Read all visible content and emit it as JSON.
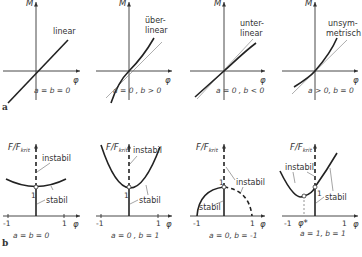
{
  "figure": {
    "part_a": {
      "label": "a",
      "y_axis_label": "M",
      "x_axis_label": "φ",
      "panels": [
        {
          "curve_label_1": "linear",
          "curve_label_2": "",
          "caption": "a = b = 0"
        },
        {
          "curve_label_1": "über-",
          "curve_label_2": "linear",
          "caption": "a = 0 , b > 0"
        },
        {
          "curve_label_1": "unter-",
          "curve_label_2": "linear",
          "caption": "a = 0 , b < 0"
        },
        {
          "curve_label_1": "unsym-",
          "curve_label_2": "metrisch",
          "caption": "a > 0, b = 0"
        }
      ]
    },
    "part_b": {
      "label": "b",
      "y_axis_label": "F/F",
      "y_axis_sub": "krit",
      "x_axis_label": "φ",
      "tick_neg": "-1",
      "tick_pos": "1",
      "tick_one": "1",
      "panels": [
        {
          "instabil": "instabil",
          "stabil": "stabil",
          "caption": "a = b = 0"
        },
        {
          "instabil": "instabil",
          "stabil": "stabil",
          "caption": "a = 0 , b = 1"
        },
        {
          "instabil": "instabil",
          "stabil": "stabil",
          "caption": "a = 0, b = -1"
        },
        {
          "instabil": "instabil",
          "stabil": "stabil",
          "caption": "a = 1, b = 1",
          "phi_star": "φ*"
        }
      ]
    }
  }
}
